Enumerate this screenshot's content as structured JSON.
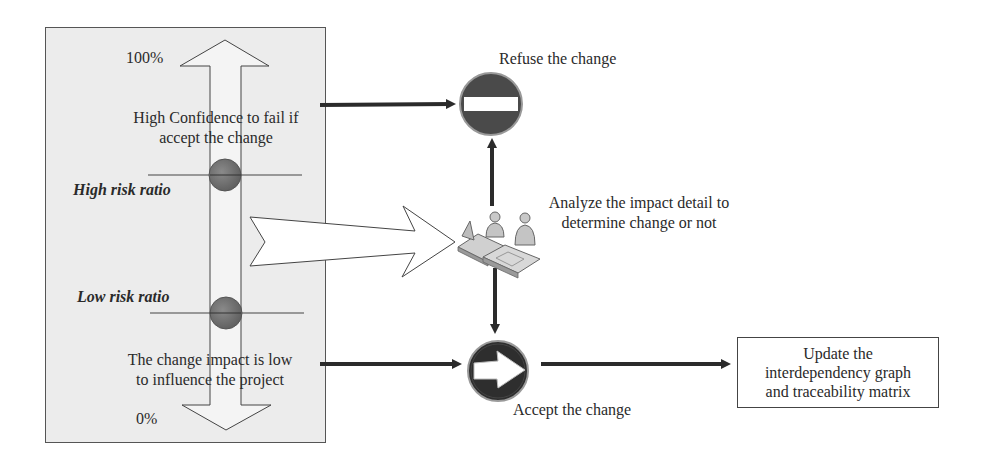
{
  "scale": {
    "top_label": "100%",
    "bottom_label": "0%",
    "high_confidence_text_line1": "High Confidence to fail if",
    "high_confidence_text_line2": "accept the change",
    "high_risk_label": "High risk ratio",
    "low_risk_label": "Low risk ratio",
    "low_impact_text_line1": "The change impact is low",
    "low_impact_text_line2": "to influence the project"
  },
  "nodes": {
    "refuse": {
      "label": "Refuse the change",
      "icon": "no-entry-sign-icon",
      "color": "#4a4a4a"
    },
    "analyze": {
      "label_line1": "Analyze the impact detail to",
      "label_line2": "determine change or not",
      "icon": "meeting-people-icon"
    },
    "accept": {
      "label": "Accept the change",
      "icon": "right-arrow-sign-icon",
      "color": "#2e2e2e"
    },
    "update": {
      "label_line1": "Update the",
      "label_line2": "interdependency graph",
      "label_line3": "and traceability matrix"
    }
  },
  "colors": {
    "panel_bg": "#ececec",
    "risk_marker": "#6b6b6b",
    "arrow_stroke": "#2b2b2b"
  }
}
